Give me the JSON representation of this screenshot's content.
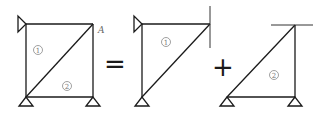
{
  "diagram": {
    "operators": {
      "equals": "=",
      "plus": "+"
    },
    "figures": [
      {
        "id": "full",
        "members": [
          "1",
          "2"
        ],
        "member_labels": {
          "m1": "1",
          "m2": "2"
        },
        "node_label": "A",
        "supports": [
          "pin-left-top",
          "pin-bottom-left",
          "pin-bottom-right"
        ]
      },
      {
        "id": "part-1",
        "members": [
          "1"
        ],
        "member_labels": {
          "m1": "1"
        },
        "supports": [
          "pin-left-top",
          "pin-bottom-left"
        ],
        "restraint": "vertical-line-at-A"
      },
      {
        "id": "part-2",
        "members": [
          "2"
        ],
        "member_labels": {
          "m2": "2"
        },
        "supports": [
          "pin-bottom-left",
          "pin-bottom-right"
        ],
        "restraint": "horizontal-line-at-A"
      }
    ],
    "colors": {
      "line": "#1a1a1a",
      "label": "#777777"
    }
  }
}
